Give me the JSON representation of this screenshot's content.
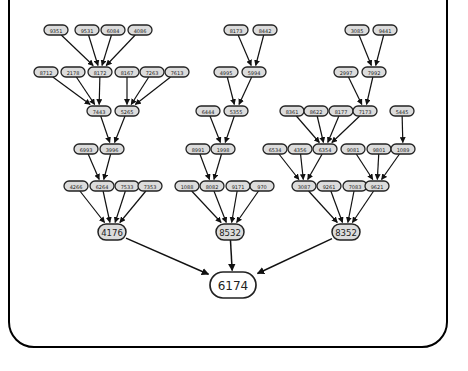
{
  "diagram": {
    "root": {
      "id": "r",
      "label": "6174",
      "x": 233,
      "y": 285
    },
    "nodes": [
      {
        "id": "a1",
        "label": "9351",
        "x": 56,
        "y": 30
      },
      {
        "id": "a2",
        "label": "9531",
        "x": 87,
        "y": 30
      },
      {
        "id": "a3",
        "label": "6084",
        "x": 113,
        "y": 30
      },
      {
        "id": "a4",
        "label": "4086",
        "x": 140,
        "y": 30
      },
      {
        "id": "b1",
        "label": "8712",
        "x": 46,
        "y": 72
      },
      {
        "id": "b2",
        "label": "2178",
        "x": 73,
        "y": 72
      },
      {
        "id": "b3",
        "label": "8172",
        "x": 100,
        "y": 72
      },
      {
        "id": "b4",
        "label": "8167",
        "x": 127,
        "y": 72
      },
      {
        "id": "b5",
        "label": "7263",
        "x": 152,
        "y": 72
      },
      {
        "id": "b6",
        "label": "7613",
        "x": 177,
        "y": 72
      },
      {
        "id": "c1",
        "label": "7443",
        "x": 99,
        "y": 111
      },
      {
        "id": "c2",
        "label": "5265",
        "x": 127,
        "y": 111
      },
      {
        "id": "d1",
        "label": "6993",
        "x": 86,
        "y": 149
      },
      {
        "id": "d2",
        "label": "3996",
        "x": 112,
        "y": 149
      },
      {
        "id": "e1",
        "label": "4266",
        "x": 76,
        "y": 186
      },
      {
        "id": "e2",
        "label": "6264",
        "x": 102,
        "y": 186
      },
      {
        "id": "e3",
        "label": "7533",
        "x": 127,
        "y": 186
      },
      {
        "id": "e4",
        "label": "7353",
        "x": 150,
        "y": 186
      },
      {
        "id": "f1",
        "label": "8173",
        "x": 236,
        "y": 30
      },
      {
        "id": "f2",
        "label": "8442",
        "x": 265,
        "y": 30
      },
      {
        "id": "g1",
        "label": "4995",
        "x": 226,
        "y": 72
      },
      {
        "id": "g2",
        "label": "5994",
        "x": 254,
        "y": 72
      },
      {
        "id": "h1",
        "label": "6444",
        "x": 208,
        "y": 111
      },
      {
        "id": "h2",
        "label": "5355",
        "x": 236,
        "y": 111
      },
      {
        "id": "i1",
        "label": "8991",
        "x": 198,
        "y": 149
      },
      {
        "id": "i2",
        "label": "1998",
        "x": 223,
        "y": 149
      },
      {
        "id": "j1",
        "label": "1088",
        "x": 187,
        "y": 186
      },
      {
        "id": "j2",
        "label": "8082",
        "x": 212,
        "y": 186
      },
      {
        "id": "j3",
        "label": "9171",
        "x": 238,
        "y": 186
      },
      {
        "id": "j4",
        "label": "970",
        "x": 262,
        "y": 186
      },
      {
        "id": "k1",
        "label": "3085",
        "x": 357,
        "y": 30
      },
      {
        "id": "k2",
        "label": "9441",
        "x": 385,
        "y": 30
      },
      {
        "id": "l1",
        "label": "2997",
        "x": 346,
        "y": 72
      },
      {
        "id": "l2",
        "label": "7992",
        "x": 374,
        "y": 72
      },
      {
        "id": "m1",
        "label": "8361",
        "x": 292,
        "y": 111
      },
      {
        "id": "m2",
        "label": "8622",
        "x": 316,
        "y": 111
      },
      {
        "id": "m3",
        "label": "8177",
        "x": 341,
        "y": 111
      },
      {
        "id": "m4",
        "label": "7173",
        "x": 365,
        "y": 111
      },
      {
        "id": "m5",
        "label": "5445",
        "x": 402,
        "y": 111
      },
      {
        "id": "n1",
        "label": "6534",
        "x": 275,
        "y": 149
      },
      {
        "id": "n2",
        "label": "4356",
        "x": 300,
        "y": 149
      },
      {
        "id": "n3",
        "label": "6354",
        "x": 325,
        "y": 149
      },
      {
        "id": "n4",
        "label": "9081",
        "x": 353,
        "y": 149
      },
      {
        "id": "n5",
        "label": "9801",
        "x": 379,
        "y": 149
      },
      {
        "id": "n6",
        "label": "1089",
        "x": 403,
        "y": 149
      },
      {
        "id": "o1",
        "label": "3087",
        "x": 304,
        "y": 186
      },
      {
        "id": "o2",
        "label": "9261",
        "x": 329,
        "y": 186
      },
      {
        "id": "o3",
        "label": "7083",
        "x": 355,
        "y": 186
      },
      {
        "id": "o4",
        "label": "9621",
        "x": 377,
        "y": 186
      }
    ],
    "mid_nodes": [
      {
        "id": "p1",
        "label": "4176",
        "x": 112,
        "y": 232
      },
      {
        "id": "p2",
        "label": "8532",
        "x": 230,
        "y": 232
      },
      {
        "id": "p3",
        "label": "8352",
        "x": 346,
        "y": 232
      }
    ],
    "edges": [
      [
        "a1",
        "b3"
      ],
      [
        "a2",
        "b3"
      ],
      [
        "a3",
        "b3"
      ],
      [
        "a4",
        "b3"
      ],
      [
        "b1",
        "c1"
      ],
      [
        "b2",
        "c1"
      ],
      [
        "b3",
        "c1"
      ],
      [
        "b4",
        "c2"
      ],
      [
        "b5",
        "c2"
      ],
      [
        "b6",
        "c2"
      ],
      [
        "c1",
        "d2"
      ],
      [
        "c2",
        "d2"
      ],
      [
        "d1",
        "e2"
      ],
      [
        "d2",
        "e2"
      ],
      [
        "e1",
        "p1"
      ],
      [
        "e2",
        "p1"
      ],
      [
        "e3",
        "p1"
      ],
      [
        "e4",
        "p1"
      ],
      [
        "f1",
        "g2"
      ],
      [
        "f2",
        "g2"
      ],
      [
        "g1",
        "h2"
      ],
      [
        "g2",
        "h2"
      ],
      [
        "h1",
        "i2"
      ],
      [
        "h2",
        "i2"
      ],
      [
        "i1",
        "j2"
      ],
      [
        "i2",
        "j2"
      ],
      [
        "j1",
        "p2"
      ],
      [
        "j2",
        "p2"
      ],
      [
        "j3",
        "p2"
      ],
      [
        "j4",
        "p2"
      ],
      [
        "k1",
        "l2"
      ],
      [
        "k2",
        "l2"
      ],
      [
        "l1",
        "m4"
      ],
      [
        "l2",
        "m4"
      ],
      [
        "m1",
        "n3"
      ],
      [
        "m2",
        "n3"
      ],
      [
        "m3",
        "n3"
      ],
      [
        "m4",
        "n3"
      ],
      [
        "m5",
        "n6"
      ],
      [
        "n1",
        "o1"
      ],
      [
        "n2",
        "o1"
      ],
      [
        "n3",
        "o1"
      ],
      [
        "n4",
        "o4"
      ],
      [
        "n5",
        "o4"
      ],
      [
        "n6",
        "o4"
      ],
      [
        "o1",
        "p3"
      ],
      [
        "o2",
        "p3"
      ],
      [
        "o3",
        "p3"
      ],
      [
        "o4",
        "p3"
      ]
    ],
    "root_edges": [
      [
        "p1",
        "r"
      ],
      [
        "p2",
        "r"
      ],
      [
        "p3",
        "r"
      ]
    ]
  }
}
